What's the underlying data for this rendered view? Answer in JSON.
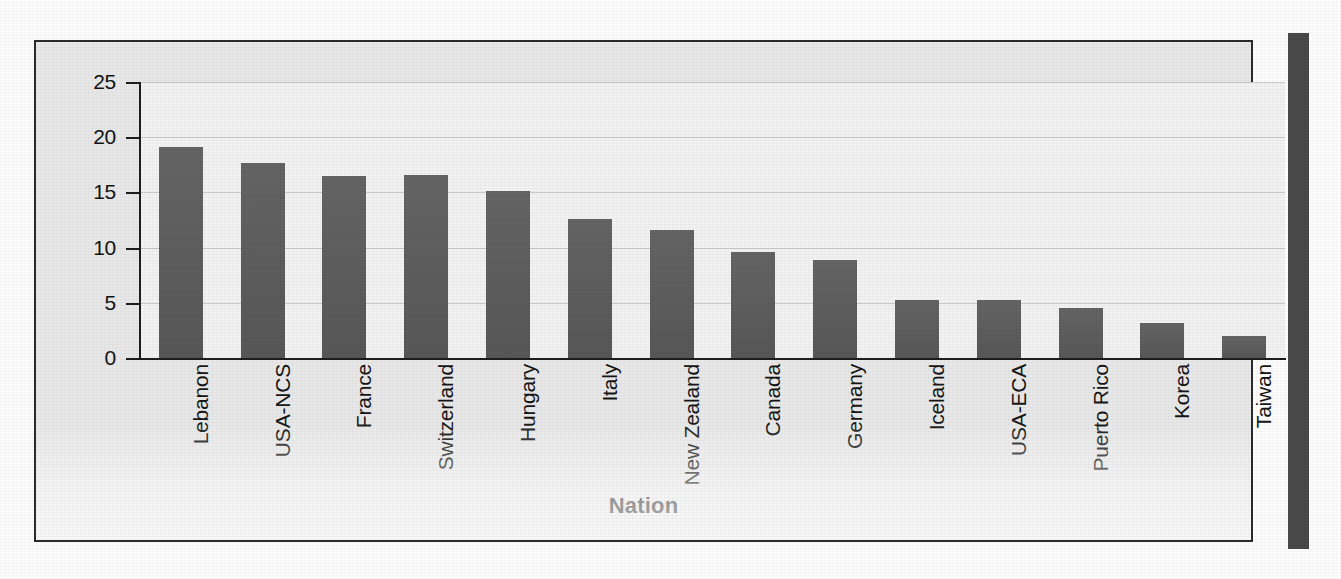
{
  "figure": {
    "background_color": "#e8e8e8",
    "plot_background_color": "#f2f2f2",
    "frame_color": "#2b2b2b",
    "bar_color": "#5c5c5c",
    "gridline_color": "#c9c9c9"
  },
  "chart_data": {
    "type": "bar",
    "title": "",
    "xlabel": "Nation",
    "ylabel": "Prevalence (%)",
    "ylim": [
      0,
      25
    ],
    "yticks": [
      0,
      5,
      10,
      15,
      20,
      25
    ],
    "ytick_labels": [
      "0",
      "5",
      "10",
      "15",
      "20",
      "25"
    ],
    "grid": true,
    "grid_axis": "y",
    "legend": false,
    "orientation": "vertical",
    "categories": [
      "Lebanon",
      "USA-NCS",
      "France",
      "Switzerland",
      "Hungary",
      "Italy",
      "New Zealand",
      "Canada",
      "Germany",
      "Iceland",
      "USA-ECA",
      "Puerto Rico",
      "Korea",
      "Taiwan"
    ],
    "values": [
      19.1,
      17.7,
      16.5,
      16.6,
      15.1,
      12.6,
      11.6,
      9.6,
      8.9,
      5.3,
      5.3,
      4.5,
      3.2,
      2.0
    ],
    "series": [
      {
        "name": "Prevalence",
        "values": [
          19.1,
          17.7,
          16.5,
          16.6,
          15.1,
          12.6,
          11.6,
          9.6,
          8.9,
          5.3,
          5.3,
          4.5,
          3.2,
          2.0
        ]
      }
    ]
  }
}
